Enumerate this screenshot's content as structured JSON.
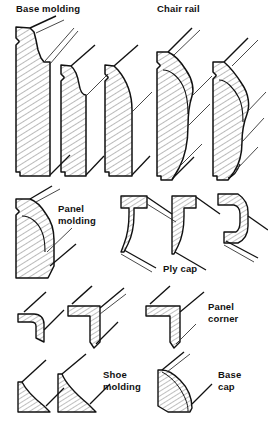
{
  "figure": {
    "title_group_1": "Base molding",
    "title_group_2": "Chair rail",
    "label_panel_molding_line1": "Panel",
    "label_panel_molding_line2": "molding",
    "label_ply_cap": "Ply cap",
    "label_panel_corner_line1": "Panel",
    "label_panel_corner_line2": "corner",
    "label_shoe_molding_line1": "Shoe",
    "label_shoe_molding_line2": "molding",
    "label_base_cap_line1": "Base",
    "label_base_cap_line2": "cap"
  },
  "colors": {
    "ink": "#111111",
    "hatch": "#444444",
    "paper": "#ffffff",
    "thin_line": "#222222"
  },
  "groups": [
    {
      "name": "base-molding",
      "label": "Base molding",
      "profile_count": 3,
      "profiles": [
        "base-molding-profile-1",
        "base-molding-profile-2",
        "base-molding-profile-3"
      ]
    },
    {
      "name": "chair-rail",
      "label": "Chair rail",
      "profile_count": 2,
      "profiles": [
        "chair-rail-profile-1",
        "chair-rail-profile-2"
      ]
    },
    {
      "name": "panel-molding",
      "label": "Panel molding",
      "profile_count": 1,
      "profiles": [
        "panel-molding-profile-1"
      ]
    },
    {
      "name": "ply-cap",
      "label": "Ply cap",
      "profile_count": 3,
      "profiles": [
        "ply-cap-profile-1",
        "ply-cap-profile-2",
        "ply-cap-profile-3"
      ]
    },
    {
      "name": "panel-corner",
      "label": "Panel corner",
      "profile_count": 3,
      "profiles": [
        "panel-corner-profile-1",
        "panel-corner-profile-2",
        "panel-corner-profile-3"
      ]
    },
    {
      "name": "shoe-molding",
      "label": "Shoe molding",
      "profile_count": 2,
      "profiles": [
        "shoe-molding-profile-1",
        "shoe-molding-profile-2"
      ]
    },
    {
      "name": "base-cap",
      "label": "Base cap",
      "profile_count": 1,
      "profiles": [
        "base-cap-profile-1"
      ]
    }
  ]
}
